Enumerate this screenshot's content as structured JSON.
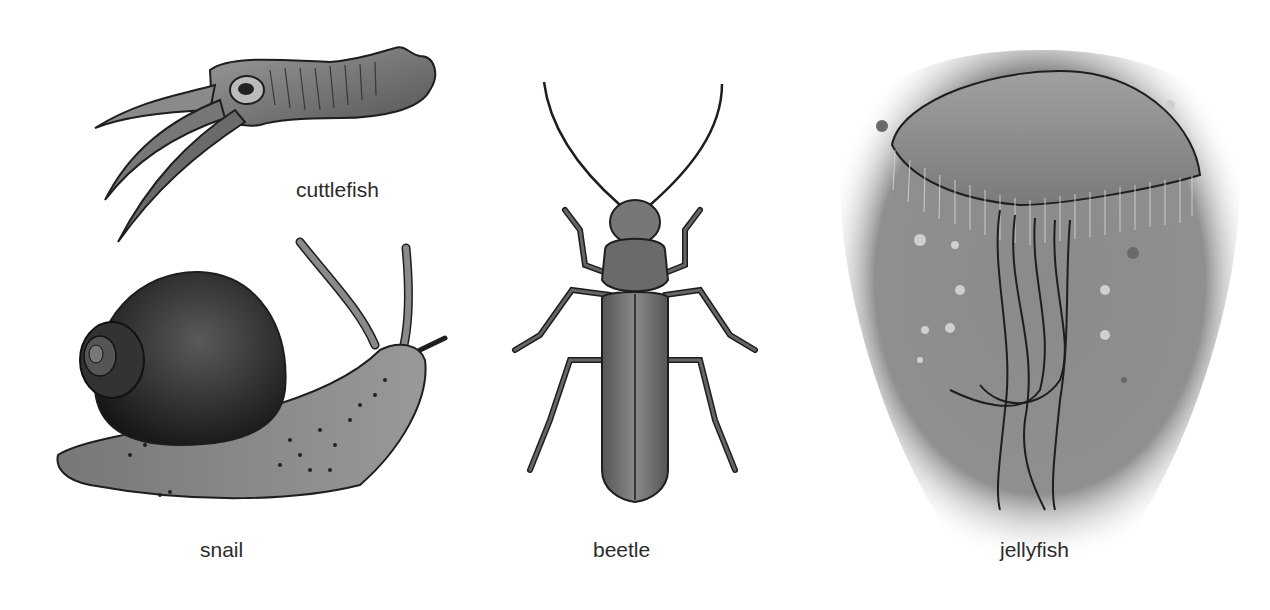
{
  "animals": [
    {
      "id": "cuttlefish",
      "label": "cuttlefish"
    },
    {
      "id": "snail",
      "label": "snail"
    },
    {
      "id": "beetle",
      "label": "beetle"
    },
    {
      "id": "jellyfish",
      "label": "jellyfish"
    }
  ],
  "colors": {
    "background": "#ffffff",
    "label_text": "#2b2b2b",
    "outline": "#1e1e1e",
    "jellyfish_water": "#8a8a8a"
  }
}
